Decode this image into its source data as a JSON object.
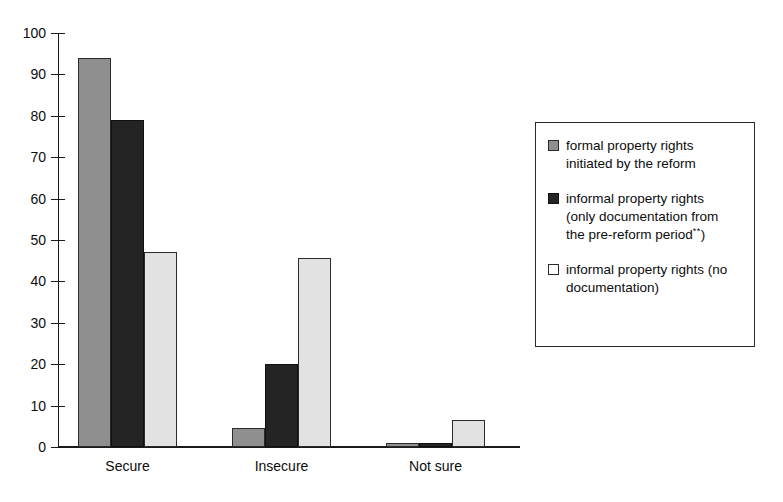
{
  "chart_data": {
    "type": "bar",
    "title": "",
    "subtitle": "",
    "xlabel": "",
    "ylabel": "",
    "ylim": [
      0,
      100
    ],
    "yticks": [
      0,
      10,
      20,
      30,
      40,
      50,
      60,
      70,
      80,
      90,
      100
    ],
    "grid": false,
    "legend_position": "right",
    "categories": [
      "Secure",
      "Insecure",
      "Not sure"
    ],
    "series": [
      {
        "name": "formal property rights initiated by the reform",
        "color": "#8f8f8f",
        "values": [
          94,
          4.7,
          1
        ]
      },
      {
        "name": "informal property rights (only documentation from the pre-reform period**)",
        "color": "#242424",
        "values": [
          79,
          20,
          1
        ]
      },
      {
        "name": "informal property rights (no documentation)",
        "color": "#e2e2e2",
        "values": [
          47,
          45.6,
          6.5
        ]
      }
    ]
  },
  "axis": {
    "y_tick_labels": [
      "100",
      "90",
      "80",
      "70",
      "60",
      "50",
      "40",
      "30",
      "20",
      "10",
      "0"
    ],
    "x_tick_labels": [
      "Secure",
      "Insecure",
      "Not sure"
    ]
  },
  "legend": {
    "entries": [
      {
        "swatch": "gray-filled-square",
        "line1": "formal property rights",
        "line2": "initiated by the reform",
        "line3": ""
      },
      {
        "swatch": "black-filled-square",
        "line1": "informal property rights",
        "line2": "(only documentation from",
        "line3": "the pre-reform period",
        "sup": "**",
        "line3_tail": ")"
      },
      {
        "swatch": "white-filled-square",
        "line1": "informal property rights (no",
        "line2": "documentation)",
        "line3": ""
      }
    ]
  }
}
